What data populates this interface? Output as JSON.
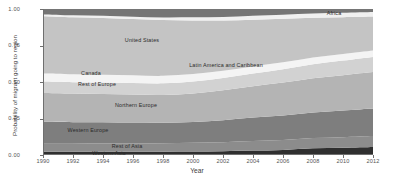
{
  "chart_data": {
    "type": "area",
    "title": "",
    "xlabel": "Year",
    "ylabel": "Probability of migrant going to region",
    "xlim": [
      1990,
      2012
    ],
    "ylim": [
      0,
      1
    ],
    "grid": false,
    "legend_position": "inline-labels",
    "stacked": true,
    "normalized": true,
    "x": [
      1990,
      1992,
      1994,
      1996,
      1998,
      2000,
      2002,
      2004,
      2006,
      2008,
      2010,
      2012
    ],
    "xtick_labels": [
      "1990",
      "1992",
      "1994",
      "1996",
      "1998",
      "2000",
      "2002",
      "2004",
      "2006",
      "2008",
      "2010",
      "2012"
    ],
    "ytick_labels": [
      "0.00",
      "0.25",
      "0.50",
      "0.75",
      "1.00"
    ],
    "ytick_values": [
      0.0,
      0.25,
      0.5,
      0.75,
      1.0
    ],
    "series": [
      {
        "name": "Western Asia",
        "color": "#2f2f2f",
        "values": [
          0.022,
          0.022,
          0.022,
          0.022,
          0.023,
          0.024,
          0.026,
          0.03,
          0.035,
          0.046,
          0.05,
          0.055
        ],
        "label": {
          "x": 1994.4,
          "y": 0.012,
          "text": "Western Asia"
        }
      },
      {
        "name": "Rest of Asia",
        "color": "#8c8c8c",
        "values": [
          0.055,
          0.055,
          0.056,
          0.057,
          0.058,
          0.06,
          0.062,
          0.066,
          0.068,
          0.07,
          0.072,
          0.075
        ],
        "label": {
          "x": 1995.6,
          "y": 0.062,
          "text": "Rest of Asia"
        }
      },
      {
        "name": "Western Europe",
        "color": "#7e7e7e",
        "values": [
          0.15,
          0.148,
          0.146,
          0.143,
          0.14,
          0.142,
          0.15,
          0.16,
          0.168,
          0.175,
          0.182,
          0.188
        ],
        "label": {
          "x": 1993.0,
          "y": 0.168,
          "text": "Western Europe"
        }
      },
      {
        "name": "Northern Europe",
        "color": "#b4b4b4",
        "values": [
          0.198,
          0.196,
          0.194,
          0.192,
          0.19,
          0.196,
          0.205,
          0.215,
          0.225,
          0.235,
          0.243,
          0.25
        ],
        "label": {
          "x": 1996.2,
          "y": 0.34,
          "text": "Northern Europe"
        }
      },
      {
        "name": "Rest of Europe",
        "color": "#d2d2d2",
        "values": [
          0.078,
          0.078,
          0.079,
          0.08,
          0.08,
          0.082,
          0.085,
          0.088,
          0.092,
          0.096,
          0.1,
          0.104
        ],
        "label": {
          "x": 1993.6,
          "y": 0.487,
          "text": "Rest of Europe"
        }
      },
      {
        "name": "Canada",
        "color": "#f4f4f4",
        "values": [
          0.055,
          0.054,
          0.053,
          0.052,
          0.051,
          0.05,
          0.049,
          0.048,
          0.047,
          0.046,
          0.045,
          0.044
        ],
        "label": {
          "x": 1993.2,
          "y": 0.565,
          "text": "Canada"
        }
      },
      {
        "name": "United States",
        "color": "#c4c4c4",
        "values": [
          0.392,
          0.39,
          0.388,
          0.385,
          0.382,
          0.368,
          0.344,
          0.32,
          0.298,
          0.272,
          0.252,
          0.232
        ],
        "label": {
          "x": 1996.6,
          "y": 0.79,
          "text": "United States"
        }
      },
      {
        "name": "Latin America and Caribbean",
        "color": "#f0f0f0",
        "values": [
          0.013,
          0.014,
          0.015,
          0.016,
          0.018,
          0.021,
          0.024,
          0.026,
          0.028,
          0.029,
          0.03,
          0.031
        ],
        "label": {
          "x": 2002.2,
          "y": 0.618,
          "text": "Latin America and Caribbean"
        }
      },
      {
        "name": "Africa",
        "color": "#757575",
        "values": [
          0.037,
          0.043,
          0.047,
          0.053,
          0.058,
          0.057,
          0.055,
          0.047,
          0.039,
          0.031,
          0.026,
          0.021
        ],
        "label": {
          "x": 2009.4,
          "y": 0.975,
          "text": "Africa"
        }
      }
    ]
  }
}
